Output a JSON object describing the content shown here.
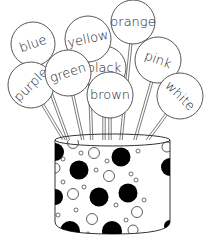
{
  "illustration": {
    "title": "Color words lollipops in polka-dot vase",
    "colors": {
      "line": "#333333",
      "dot_fill": "#000000",
      "background": "#ffffff"
    },
    "words": [
      {
        "label": "blue",
        "cx": 33,
        "cy": 44,
        "r": 22,
        "rot": -20,
        "stick_to": [
          72,
          150
        ]
      },
      {
        "label": "yellow",
        "cx": 88,
        "cy": 39,
        "r": 23,
        "rot": -12,
        "stick_to": [
          92,
          150
        ]
      },
      {
        "label": "orange",
        "cx": 133,
        "cy": 22,
        "r": 22,
        "rot": 0,
        "stick_to": [
          120,
          150
        ]
      },
      {
        "label": "black",
        "cx": 104,
        "cy": 68,
        "r": 22,
        "rot": 0,
        "stick_to": [
          104,
          150
        ]
      },
      {
        "label": "purple",
        "cx": 31,
        "cy": 85,
        "r": 23,
        "rot": -45,
        "stick_to": [
          70,
          150
        ]
      },
      {
        "label": "green",
        "cx": 68,
        "cy": 73,
        "r": 23,
        "rot": -18,
        "stick_to": [
          85,
          150
        ]
      },
      {
        "label": "pink",
        "cx": 158,
        "cy": 60,
        "r": 23,
        "rot": 20,
        "stick_to": [
          132,
          150
        ]
      },
      {
        "label": "brown",
        "cx": 110,
        "cy": 95,
        "r": 23,
        "rot": 0,
        "stick_to": [
          110,
          150
        ]
      },
      {
        "label": "white",
        "cx": 180,
        "cy": 96,
        "r": 23,
        "rot": 45,
        "stick_to": [
          140,
          150
        ]
      }
    ],
    "vase": {
      "x": 55,
      "top": 137,
      "width": 115,
      "bottom": 234
    }
  }
}
